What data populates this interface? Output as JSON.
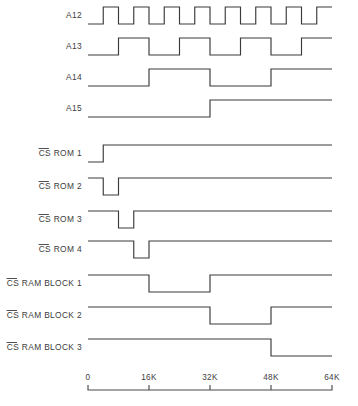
{
  "figure": {
    "kind": "timing-diagram",
    "title": "",
    "background_color": "#ffffff",
    "line_color": "#3a3a3a",
    "text_color": "#3c3c3c"
  },
  "axis": {
    "label": "",
    "min": 0,
    "max": 64,
    "unit": "K",
    "tick_values": [
      0,
      16,
      32,
      48,
      64
    ],
    "tick_labels": [
      "0",
      "16K",
      "32K",
      "48K",
      "64K"
    ],
    "pixel_start": 88,
    "pixel_end": 332,
    "grid": false
  },
  "signals": [
    {
      "id": "a12",
      "label": "A12",
      "label_overbar": false,
      "active_low": false,
      "row_y": 24,
      "period_k": 8,
      "starts_low": true,
      "transitions_k": [
        4,
        8,
        12,
        16,
        20,
        24,
        28,
        32,
        36,
        40,
        44,
        48,
        52,
        56,
        60
      ],
      "initial_level": "low"
    },
    {
      "id": "a13",
      "label": "A13",
      "label_overbar": false,
      "active_low": false,
      "row_y": 55,
      "period_k": 16,
      "starts_low": true,
      "transitions_k": [
        8,
        16,
        24,
        32,
        40,
        48,
        56
      ],
      "initial_level": "low"
    },
    {
      "id": "a14",
      "label": "A14",
      "label_overbar": false,
      "active_low": false,
      "row_y": 86,
      "period_k": 32,
      "starts_low": true,
      "transitions_k": [
        16,
        32,
        48
      ],
      "initial_level": "low"
    },
    {
      "id": "a15",
      "label": "A15",
      "label_overbar": false,
      "active_low": false,
      "row_y": 117,
      "period_k": 64,
      "starts_low": true,
      "transitions_k": [
        32
      ],
      "initial_level": "low"
    },
    {
      "id": "cs-rom-1",
      "label": "CS ROM 1",
      "label_overbar": true,
      "overbar_chars": "CS",
      "active_low": true,
      "row_y": 162,
      "low_windows_k": [
        [
          0,
          4
        ]
      ],
      "initial_level": "low"
    },
    {
      "id": "cs-rom-2",
      "label": "CS ROM 2",
      "label_overbar": true,
      "overbar_chars": "CS",
      "active_low": true,
      "row_y": 195,
      "low_windows_k": [
        [
          4,
          8
        ]
      ],
      "initial_level": "high"
    },
    {
      "id": "cs-rom-3",
      "label": "CS ROM 3",
      "label_overbar": true,
      "overbar_chars": "CS",
      "active_low": true,
      "row_y": 228,
      "low_windows_k": [
        [
          8,
          12
        ]
      ],
      "initial_level": "high"
    },
    {
      "id": "cs-rom-4",
      "label": "CS ROM 4",
      "label_overbar": true,
      "overbar_chars": "CS",
      "active_low": true,
      "row_y": 258,
      "low_windows_k": [
        [
          12,
          16
        ]
      ],
      "initial_level": "high"
    },
    {
      "id": "cs-ram-block-1",
      "label": "CS RAM BLOCK 1",
      "label_overbar": true,
      "overbar_chars": "CS",
      "active_low": true,
      "row_y": 292,
      "low_windows_k": [
        [
          16,
          32
        ]
      ],
      "initial_level": "high"
    },
    {
      "id": "cs-ram-block-2",
      "label": "CS RAM BLOCK 2",
      "label_overbar": true,
      "overbar_chars": "CS",
      "active_low": true,
      "row_y": 324,
      "low_windows_k": [
        [
          32,
          48
        ]
      ],
      "initial_level": "high"
    },
    {
      "id": "cs-ram-block-3",
      "label": "CS RAM BLOCK 3",
      "label_overbar": true,
      "overbar_chars": "CS",
      "active_low": true,
      "row_y": 356,
      "low_windows_k": [
        [
          48,
          64
        ]
      ],
      "initial_level": "high"
    }
  ],
  "chart_data": {
    "type": "line",
    "title": "",
    "xlabel": "",
    "ylabel": "",
    "x": [
      0,
      4,
      8,
      12,
      16,
      20,
      24,
      28,
      32,
      36,
      40,
      44,
      48,
      52,
      56,
      60,
      64
    ],
    "xlim": [
      0,
      64
    ],
    "grid": false,
    "legend_position": "left",
    "tick_labels": [
      "0",
      "16K",
      "32K",
      "48K",
      "64K"
    ],
    "series": [
      {
        "name": "A12",
        "values": [
          0,
          1,
          0,
          1,
          0,
          1,
          0,
          1,
          0,
          1,
          0,
          1,
          0,
          1,
          0,
          1,
          0
        ]
      },
      {
        "name": "A13",
        "values": [
          0,
          0,
          1,
          1,
          0,
          0,
          1,
          1,
          0,
          0,
          1,
          1,
          0,
          0,
          1,
          1,
          0
        ]
      },
      {
        "name": "A14",
        "values": [
          0,
          0,
          0,
          0,
          1,
          1,
          1,
          1,
          0,
          0,
          0,
          0,
          1,
          1,
          1,
          1,
          1
        ]
      },
      {
        "name": "A15",
        "values": [
          0,
          0,
          0,
          0,
          0,
          0,
          0,
          0,
          1,
          1,
          1,
          1,
          1,
          1,
          1,
          1,
          1
        ]
      },
      {
        "name": "CS ROM 1",
        "values": [
          0,
          0,
          1,
          1,
          1,
          1,
          1,
          1,
          1,
          1,
          1,
          1,
          1,
          1,
          1,
          1,
          1
        ]
      },
      {
        "name": "CS ROM 2",
        "values": [
          1,
          1,
          0,
          0,
          1,
          1,
          1,
          1,
          1,
          1,
          1,
          1,
          1,
          1,
          1,
          1,
          1
        ]
      },
      {
        "name": "CS ROM 3",
        "values": [
          1,
          1,
          1,
          1,
          0,
          0,
          1,
          1,
          1,
          1,
          1,
          1,
          1,
          1,
          1,
          1,
          1
        ]
      },
      {
        "name": "CS ROM 4",
        "values": [
          1,
          1,
          1,
          1,
          1,
          1,
          0,
          0,
          1,
          1,
          1,
          1,
          1,
          1,
          1,
          1,
          1
        ]
      },
      {
        "name": "CS RAM BLOCK 1",
        "values": [
          1,
          1,
          1,
          1,
          0,
          0,
          0,
          0,
          1,
          1,
          1,
          1,
          1,
          1,
          1,
          1,
          1
        ]
      },
      {
        "name": "CS RAM BLOCK 2",
        "values": [
          1,
          1,
          1,
          1,
          1,
          1,
          1,
          1,
          0,
          0,
          0,
          0,
          1,
          1,
          1,
          1,
          1
        ]
      },
      {
        "name": "CS RAM BLOCK 3",
        "values": [
          1,
          1,
          1,
          1,
          1,
          1,
          1,
          1,
          1,
          1,
          1,
          1,
          0,
          0,
          0,
          0,
          0
        ]
      }
    ]
  }
}
